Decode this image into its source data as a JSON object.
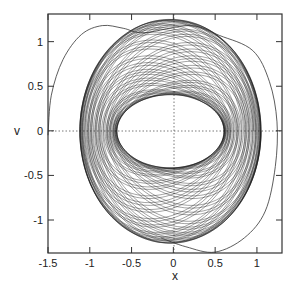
{
  "chart_data": {
    "type": "line",
    "title": "",
    "xlabel": "x",
    "ylabel": "v",
    "xlim": [
      -1.5,
      1.3
    ],
    "ylim": [
      -1.37,
      1.31
    ],
    "xticks": [
      -1.5,
      -1,
      -0.5,
      0,
      0.5,
      1
    ],
    "xtick_labels": [
      "-1.5",
      "-1",
      "-0.5",
      "0",
      "0.5",
      "1"
    ],
    "yticks": [
      -1,
      -0.5,
      0,
      0.5,
      1
    ],
    "ytick_labels": [
      "-1",
      "-0.5",
      "0",
      "0.5",
      "1"
    ],
    "grid": false,
    "zero_lines": "dotted",
    "legend": null,
    "series": [
      {
        "name": "torus",
        "kind": "quasi-periodic annulus",
        "outer_extent": {
          "x": [
            -1.12,
            1.05
          ],
          "v": [
            -1.26,
            1.25
          ]
        },
        "inner_hole_extent": {
          "x": [
            -0.63,
            0.65
          ],
          "v": [
            -0.42,
            0.4
          ]
        }
      },
      {
        "name": "transient",
        "kind": "outer trajectory",
        "points": [
          [
            -1.5,
            -0.05
          ],
          [
            -1.46,
            0.4
          ],
          [
            -1.32,
            0.8
          ],
          [
            -1.1,
            1.08
          ],
          [
            -0.85,
            1.18
          ],
          [
            -0.6,
            1.15
          ],
          [
            -0.35,
            1.1
          ],
          [
            0.2,
            1.18
          ],
          [
            0.55,
            1.07
          ],
          [
            0.95,
            0.9
          ],
          [
            1.15,
            0.55
          ],
          [
            1.24,
            0.1
          ],
          [
            1.22,
            -0.4
          ],
          [
            1.1,
            -0.9
          ],
          [
            0.85,
            -1.2
          ],
          [
            0.5,
            -1.36
          ],
          [
            0.15,
            -1.3
          ],
          [
            -0.15,
            -1.2
          ]
        ]
      }
    ]
  }
}
